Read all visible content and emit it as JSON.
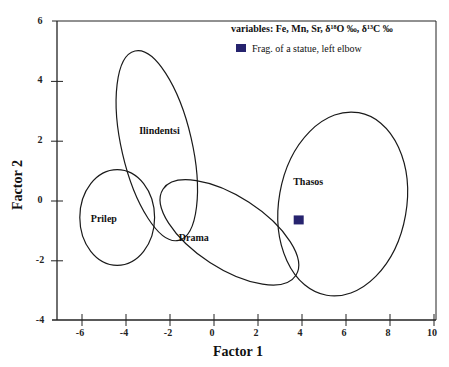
{
  "chart_data": {
    "type": "scatter",
    "title": "",
    "xlabel": "Factor 1",
    "ylabel": "Factor 2",
    "xlim": [
      -6.5,
      10
    ],
    "ylim": [
      -4,
      6
    ],
    "x_ticks": [
      -6,
      -4,
      -2,
      0,
      2,
      4,
      6,
      8,
      10
    ],
    "y_ticks": [
      6,
      4,
      2,
      0,
      -2,
      -4
    ],
    "grid": false,
    "legend": {
      "title": "variables: Fe, Mn, Sr, δ¹⁸O ‰, δ¹³C ‰",
      "position": "upper right",
      "entries": [
        {
          "label": "Frag. of a statue, left elbow",
          "marker": "square",
          "color": "#26236e"
        }
      ]
    },
    "groups": [
      {
        "name": "Prilep",
        "type": "ellipse",
        "center": [
          -4.4,
          -0.55
        ],
        "rx": 1.7,
        "ry": 1.6,
        "angle_deg": 0,
        "label_pos": [
          -5.6,
          -0.7
        ]
      },
      {
        "name": "Ilindentsi",
        "type": "ellipse",
        "center": [
          -2.6,
          1.85
        ],
        "rx": 1.6,
        "ry": 3.25,
        "angle_deg": 13,
        "label_pos": [
          -3.4,
          2.25
        ]
      },
      {
        "name": "Drama",
        "type": "ellipse",
        "center": [
          0.7,
          -1.05
        ],
        "rx": 3.6,
        "ry": 1.2,
        "angle_deg": -33,
        "label_pos": [
          -1.6,
          -1.35
        ]
      },
      {
        "name": "Thasos",
        "type": "ellipse",
        "center": [
          5.85,
          -0.1
        ],
        "rx": 2.9,
        "ry": 3.1,
        "angle_deg": -10,
        "label_pos": [
          3.6,
          0.55
        ]
      }
    ],
    "points": [
      {
        "series": "Frag. of a statue, left elbow",
        "x": 3.85,
        "y": -0.65,
        "marker": "square",
        "color": "#26236e"
      }
    ]
  },
  "ui": {
    "x_tick_labels": [
      "-6",
      "-4",
      "-2",
      "0",
      "2",
      "4",
      "6",
      "8",
      "10"
    ],
    "y_tick_labels": [
      "6",
      "4",
      "2",
      "0",
      "-2",
      "-4"
    ],
    "colors": {
      "axis": "#222222",
      "ellipse": "#1a1a1a",
      "marker": "#26236e"
    }
  }
}
